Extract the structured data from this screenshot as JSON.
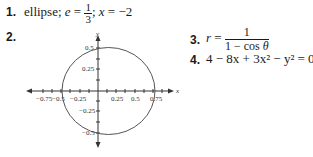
{
  "items": [
    {
      "number": "1.",
      "text_prefix": "ellipse; ",
      "e_var": "e",
      "eq": " = ",
      "frac_num": "1",
      "frac_den": "3",
      "sep": "; ",
      "x_var": "x",
      "x_eq": " = −2"
    },
    {
      "number": "2."
    },
    {
      "number": "3.",
      "r_var": "r",
      "eq": " = ",
      "frac_num": "1",
      "frac_den_prefix": "1 − cos ",
      "theta": "θ"
    },
    {
      "number": "4.",
      "equation": "4 − 8x + 3x² − y² = 0"
    }
  ],
  "graph": {
    "x_axis_label": "x",
    "y_axis_label": "y",
    "x_ticks": [
      "−0.75",
      "−0.5",
      "−0.25",
      "0.25",
      "0.5",
      "0.75"
    ],
    "y_ticks": [
      "0.5",
      "0.25",
      "−0.25",
      "−0.5"
    ],
    "curve_color": "#555555"
  }
}
